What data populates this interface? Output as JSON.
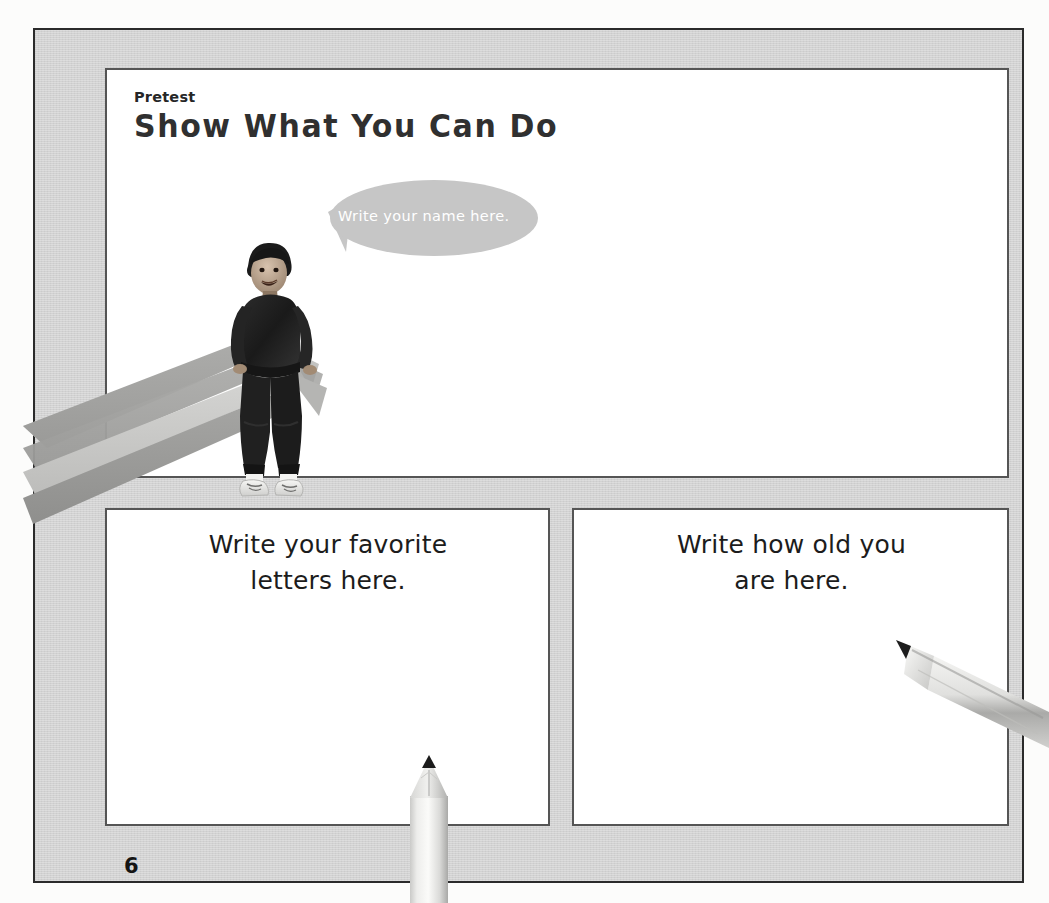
{
  "page": {
    "label_pretest": "Pretest",
    "title": "Show What You Can Do",
    "page_number": "6"
  },
  "speech_bubble": {
    "text": "Write your name here.",
    "fill_color": "#c6c6c6",
    "text_color": "#ffffff"
  },
  "boxes": [
    {
      "name": "name-box",
      "prompt": ""
    },
    {
      "name": "favorite-letters-box",
      "prompt": "Write your favorite letters here."
    },
    {
      "name": "age-box",
      "prompt": "Write how old you are here."
    }
  ],
  "prompts": {
    "left_line1": "Write your favorite",
    "left_line2": "letters here.",
    "right_line1": "Write how old you",
    "right_line2": "are here."
  },
  "illustrations": {
    "diagonal_pencil": "pencil-diagonal-icon",
    "boy_photo": "boy-sitting-on-pencil-photo",
    "bottom_pencil": "pencil-vertical-icon",
    "right_pencil": "pencil-angled-icon"
  },
  "colors": {
    "page_background": "#d2d2d2",
    "page_border": "#2b2b2b",
    "box_background": "#ffffff",
    "box_border": "#555555",
    "text": "#1c1c1c",
    "pencil_light": "#f2f2f0",
    "pencil_mid": "#c9c9c7",
    "pencil_shadow": "#a2a2a0",
    "pencil_lead": "#1b1b1b"
  }
}
